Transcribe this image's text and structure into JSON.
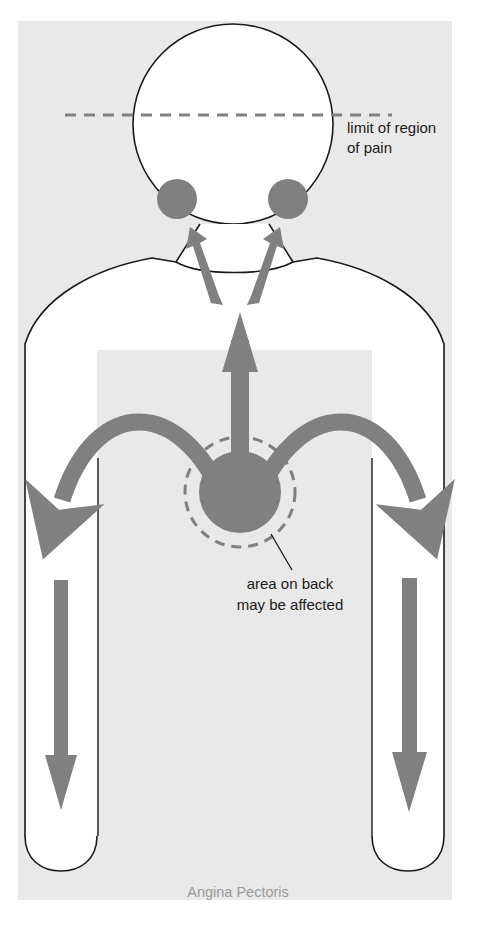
{
  "figure": {
    "caption": "Angina Pectoris",
    "background_color": "#e9e9e9",
    "page_color": "#ffffff",
    "pain_color": "#808080",
    "outline_color": "#1a1a1a",
    "caption_color": "#9a9a9a",
    "label_color": "#1a1a1a"
  },
  "annotations": {
    "limit_label": {
      "line1": "limit of region",
      "line2": "of pain"
    },
    "back_label": {
      "line1": "area on back",
      "line2": "may be affected"
    }
  },
  "diagram": {
    "title": "Angina Pectoris",
    "type": "body-pain-referral-diagram",
    "regions": [
      {
        "name": "central-chest",
        "shape": "filled-circle",
        "meaning": "primary site of pain",
        "center": [
          240,
          492
        ],
        "radius": 41
      },
      {
        "name": "back-region-ring",
        "shape": "dashed-circle",
        "meaning": "area on back may be affected",
        "center": [
          240,
          492
        ],
        "radius": 55
      },
      {
        "name": "left-jaw",
        "shape": "filled-circle",
        "meaning": "referred pain to jaw",
        "center": [
          177,
          199
        ],
        "radius": 20
      },
      {
        "name": "right-jaw",
        "shape": "filled-circle",
        "meaning": "referred pain to jaw",
        "center": [
          288,
          199
        ],
        "radius": 20
      }
    ],
    "arrows": [
      {
        "name": "central-up-arrow",
        "direction": "up",
        "meaning": "pain radiating up the sternum"
      },
      {
        "name": "left-neck-arrow",
        "direction": "up-left",
        "meaning": "pain radiating to left jaw"
      },
      {
        "name": "right-neck-arrow",
        "direction": "up-right",
        "meaning": "pain radiating to right jaw"
      },
      {
        "name": "left-curved-arm-arrow",
        "direction": "down-left",
        "meaning": "pain radiating down left arm"
      },
      {
        "name": "right-curved-arm-arrow",
        "direction": "down-right",
        "meaning": "pain radiating down right arm"
      },
      {
        "name": "left-forearm-arrow",
        "direction": "down",
        "meaning": "pain continuing into left forearm"
      },
      {
        "name": "right-forearm-arrow",
        "direction": "down",
        "meaning": "pain continuing into right forearm"
      }
    ],
    "guides": [
      {
        "name": "limit-of-pain-dashed-line",
        "orientation": "horizontal",
        "y": 115,
        "meaning": "upper limit of region of pain"
      }
    ]
  }
}
